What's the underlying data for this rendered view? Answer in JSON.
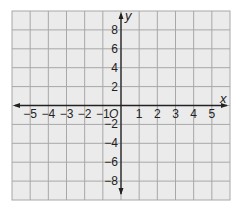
{
  "chart_data": {
    "type": "coordinate-grid",
    "title": "",
    "xlabel": "x",
    "ylabel": "y",
    "origin_label": "O",
    "x_range": [
      -6,
      6
    ],
    "y_range": [
      -10,
      10
    ],
    "x_step": 1,
    "y_step": 2,
    "x_tick_labels": [
      "-5",
      "-4",
      "-3",
      "-2",
      "-1",
      "1",
      "2",
      "3",
      "4",
      "5"
    ],
    "x_tick_values": [
      -5,
      -4,
      -3,
      -2,
      -1,
      1,
      2,
      3,
      4,
      5
    ],
    "y_tick_labels": [
      "8",
      "6",
      "4",
      "2",
      "-2",
      "-4",
      "-6",
      "-8"
    ],
    "y_tick_values": [
      8,
      6,
      4,
      2,
      -2,
      -4,
      -6,
      -8
    ],
    "grid": true,
    "columns": 12,
    "rows": 10,
    "points": []
  },
  "colors": {
    "grid_fill": "#ebebeb",
    "grid_line": "#a8a8a8",
    "axis": "#222222",
    "label": "#222222"
  },
  "layout": {
    "left": 12,
    "top": 11,
    "right": 230,
    "bottom": 200
  }
}
